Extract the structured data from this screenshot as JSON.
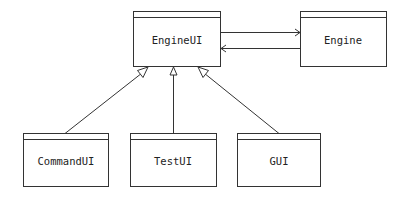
{
  "diagram": {
    "type": "UML class diagram",
    "nodes": [
      {
        "id": "engineui",
        "label": "EngineUI"
      },
      {
        "id": "engine",
        "label": "Engine"
      },
      {
        "id": "commandui",
        "label": "CommandUI"
      },
      {
        "id": "testui",
        "label": "TestUI"
      },
      {
        "id": "gui",
        "label": "GUI"
      }
    ],
    "edges": [
      {
        "from": "engineui",
        "to": "engine",
        "kind": "association",
        "arrow": "open"
      },
      {
        "from": "engine",
        "to": "engineui",
        "kind": "association",
        "arrow": "open"
      },
      {
        "from": "commandui",
        "to": "engineui",
        "kind": "generalization",
        "arrow": "hollow-triangle"
      },
      {
        "from": "testui",
        "to": "engineui",
        "kind": "generalization",
        "arrow": "hollow-triangle"
      },
      {
        "from": "gui",
        "to": "engineui",
        "kind": "generalization",
        "arrow": "hollow-triangle"
      }
    ]
  }
}
